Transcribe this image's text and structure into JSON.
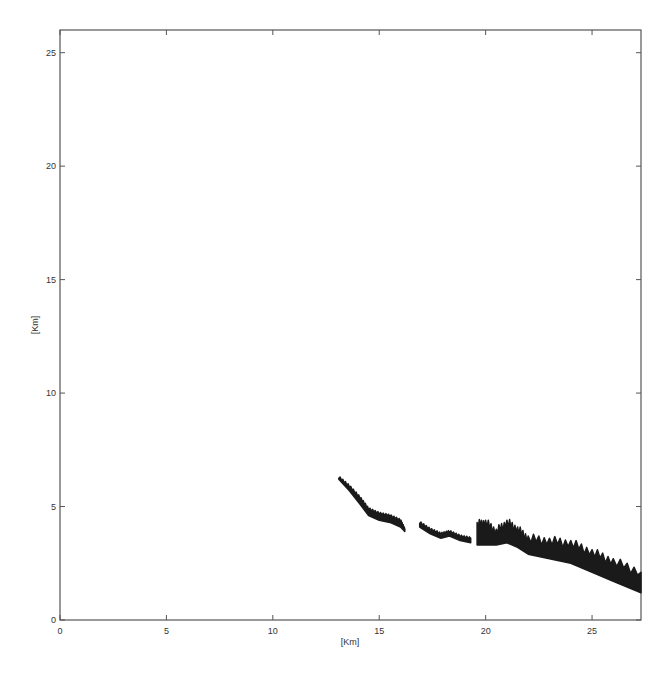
{
  "chart_data": {
    "type": "area",
    "title": "",
    "xlabel": "[Km]",
    "ylabel": "[Km]",
    "xlim": [
      0,
      27.3
    ],
    "ylim": [
      0,
      26
    ],
    "xticks": [
      0,
      5,
      10,
      15,
      20,
      25
    ],
    "yticks": [
      0,
      5,
      10,
      15,
      20,
      25
    ],
    "xtick_labels": [
      "0",
      "5",
      "10",
      "15",
      "20",
      "25"
    ],
    "ytick_labels": [
      "0",
      "5",
      "10",
      "15",
      "20",
      "25"
    ],
    "grid": false,
    "legend": null,
    "color": "#1a1a1a",
    "series": [
      {
        "name": "segment-1",
        "x": [
          13.1,
          13.6,
          14.1,
          14.5,
          15.0,
          15.5,
          16.0,
          16.2
        ],
        "y_top": [
          6.3,
          5.9,
          5.4,
          4.9,
          4.7,
          4.6,
          4.4,
          4.0
        ],
        "y_bottom": [
          6.2,
          5.7,
          5.1,
          4.6,
          4.4,
          4.3,
          4.1,
          3.9
        ]
      },
      {
        "name": "segment-2",
        "x": [
          16.9,
          17.4,
          17.9,
          18.3,
          18.8,
          19.3
        ],
        "y_top": [
          4.3,
          4.0,
          3.8,
          3.9,
          3.7,
          3.6
        ],
        "y_bottom": [
          4.1,
          3.8,
          3.6,
          3.7,
          3.5,
          3.4
        ]
      },
      {
        "name": "segment-3",
        "x": [
          19.6,
          20.0,
          20.5,
          21.0,
          21.5,
          22.0,
          23.0,
          24.0,
          25.0,
          26.0,
          27.3
        ],
        "y_top": [
          4.2,
          4.3,
          3.9,
          4.3,
          4.0,
          3.6,
          3.5,
          3.4,
          3.0,
          2.6,
          2.1
        ],
        "y_bottom": [
          3.3,
          3.3,
          3.3,
          3.4,
          3.2,
          2.9,
          2.7,
          2.5,
          2.1,
          1.7,
          1.2
        ]
      }
    ]
  }
}
